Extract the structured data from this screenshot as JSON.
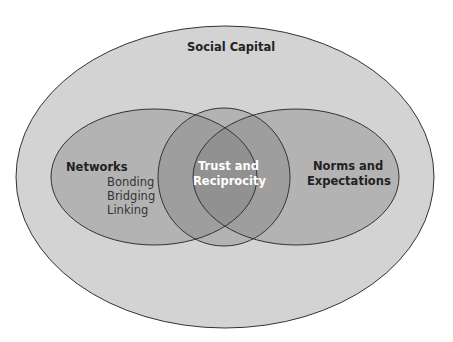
{
  "diagram": {
    "outer": {
      "label": "Social Capital"
    },
    "left": {
      "label": "Networks",
      "items": [
        "Bonding",
        "Bridging",
        "Linking"
      ]
    },
    "center": {
      "line1": "Trust and",
      "line2": "Reciprocity"
    },
    "right": {
      "line1": "Norms and",
      "line2": "Expectations"
    }
  },
  "colors": {
    "outer": "#d3d3d3",
    "set": "#a9a9a9",
    "stroke": "#333333",
    "text_dark": "#222222",
    "text_light": "#ffffff"
  }
}
